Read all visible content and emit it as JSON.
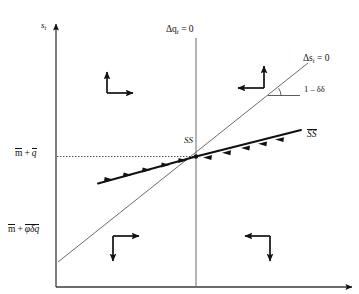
{
  "figure": {
    "background_color": "#ffffff",
    "ink_color": "#111111",
    "width": 359,
    "height": 294
  },
  "axes": {
    "y_axis_label": "s",
    "y_axis_label_sub": "t",
    "x_axis_label": "",
    "y_axis_x_px": 56,
    "x_axis_y_px": 287
  },
  "ticks": {
    "upper": {
      "text": "m + q",
      "parts": [
        "m",
        "+",
        "q"
      ],
      "overbar": true,
      "y_px": 156
    },
    "lower": {
      "text": "m + φδq",
      "parts": [
        "m",
        "+",
        "φδq"
      ],
      "overbar": true,
      "y_px": 232
    }
  },
  "loci": [
    {
      "id": "dq-zero",
      "label": "Δq",
      "label_sub": "t",
      "label_rest": " = 0",
      "orientation": "vertical",
      "x_px": 196,
      "style": "thin-solid"
    },
    {
      "id": "ds-zero",
      "label": "Δs",
      "label_sub": "t",
      "label_rest": " = 0",
      "orientation": "upward-steep",
      "style": "thin-solid"
    }
  ],
  "curves": [
    {
      "id": "saddle-path",
      "label": "SS",
      "overbar": true,
      "style": "thick-solid",
      "arrowheads": "converging-toward-steady-state",
      "description": "stable saddle path sloping gently upward through the steady state"
    }
  ],
  "annotations": {
    "slope": {
      "text": "1 – δδ",
      "description": "slope of the Δs = 0 locus measured by the marked angle"
    },
    "steady_state": {
      "label": "SS",
      "x_px": 196,
      "y_px": 156,
      "description": "steady state at intersection of the two loci"
    },
    "guide_line": {
      "style": "dotted-horizontal",
      "from_x_px": 56,
      "to_x_px": 196,
      "y_px": 156
    }
  },
  "quadrant_arrows": [
    {
      "id": "top-left",
      "quadrant": "upper-left",
      "arrows": [
        "up",
        "right"
      ],
      "corner": "bottom-left"
    },
    {
      "id": "top-right",
      "quadrant": "upper-right",
      "arrows": [
        "up",
        "left"
      ],
      "corner": "bottom-right"
    },
    {
      "id": "bottom-left",
      "quadrant": "lower-left",
      "arrows": [
        "right",
        "down"
      ],
      "corner": "top-left"
    },
    {
      "id": "bottom-right",
      "quadrant": "lower-right",
      "arrows": [
        "left",
        "down"
      ],
      "corner": "top-right"
    }
  ]
}
